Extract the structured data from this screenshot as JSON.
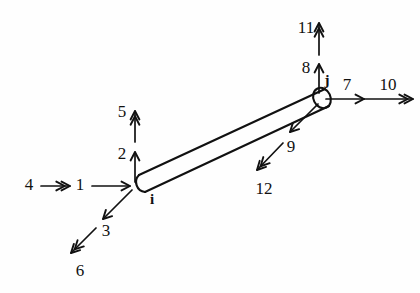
{
  "figure": {
    "nodes": [
      {
        "id": "i",
        "label": "i",
        "x": 133,
        "y": 186,
        "label_x": 152,
        "label_y": 201
      },
      {
        "id": "j",
        "label": "j",
        "x": 320,
        "y": 99,
        "label_x": 327,
        "label_y": 82
      }
    ],
    "member": {
      "from_node": "i",
      "to_node": "j",
      "shape": "round-capped-bar"
    },
    "dofs": [
      {
        "number": "1",
        "node": "i",
        "kind": "translation",
        "heads": 1,
        "direction": "right",
        "label_x": 80,
        "label_y": 186,
        "x1": 92,
        "y1": 186,
        "x2": 130,
        "y2": 186
      },
      {
        "number": "2",
        "node": "i",
        "kind": "translation",
        "heads": 1,
        "direction": "up",
        "label_x": 122,
        "label_y": 155,
        "x1": 135,
        "y1": 182,
        "x2": 135,
        "y2": 152
      },
      {
        "number": "3",
        "node": "i",
        "kind": "translation",
        "heads": 1,
        "direction": "down-left",
        "label_x": 106,
        "label_y": 232,
        "x1": 132,
        "y1": 190,
        "x2": 103,
        "y2": 219
      },
      {
        "number": "4",
        "node": "i",
        "kind": "rotation",
        "heads": 2,
        "direction": "right",
        "label_x": 29,
        "label_y": 186,
        "x1": 41,
        "y1": 186,
        "x2": 70,
        "y2": 186
      },
      {
        "number": "5",
        "node": "i",
        "kind": "rotation",
        "heads": 2,
        "direction": "up",
        "label_x": 122,
        "label_y": 113,
        "x1": 135,
        "y1": 142,
        "x2": 135,
        "y2": 111
      },
      {
        "number": "6",
        "node": "i",
        "kind": "rotation",
        "heads": 2,
        "direction": "down-left",
        "label_x": 80,
        "label_y": 272,
        "x1": 96,
        "y1": 228,
        "x2": 71,
        "y2": 253
      },
      {
        "number": "7",
        "node": "j",
        "kind": "translation",
        "heads": 1,
        "direction": "right",
        "label_x": 347,
        "label_y": 86,
        "x1": 326,
        "y1": 99,
        "x2": 364,
        "y2": 99
      },
      {
        "number": "8",
        "node": "j",
        "kind": "translation",
        "heads": 1,
        "direction": "up",
        "label_x": 306,
        "label_y": 69,
        "x1": 319,
        "y1": 93,
        "x2": 319,
        "y2": 64
      },
      {
        "number": "9",
        "node": "j",
        "kind": "translation",
        "heads": 1,
        "direction": "down-left",
        "label_x": 291,
        "label_y": 148,
        "x1": 318,
        "y1": 104,
        "x2": 290,
        "y2": 132
      },
      {
        "number": "10",
        "node": "j",
        "kind": "rotation",
        "heads": 2,
        "direction": "right",
        "label_x": 388,
        "label_y": 86,
        "x1": 362,
        "y1": 99,
        "x2": 413,
        "y2": 99
      },
      {
        "number": "11",
        "node": "j",
        "kind": "rotation",
        "heads": 2,
        "direction": "up",
        "label_x": 306,
        "label_y": 29,
        "x1": 319,
        "y1": 55,
        "x2": 319,
        "y2": 23
      },
      {
        "number": "12",
        "node": "j",
        "kind": "rotation",
        "heads": 2,
        "direction": "down-left",
        "label_x": 264,
        "label_y": 190,
        "x1": 283,
        "y1": 143,
        "x2": 257,
        "y2": 170
      }
    ]
  },
  "colors": {
    "ink": "#111111",
    "background": "#fefefe"
  }
}
